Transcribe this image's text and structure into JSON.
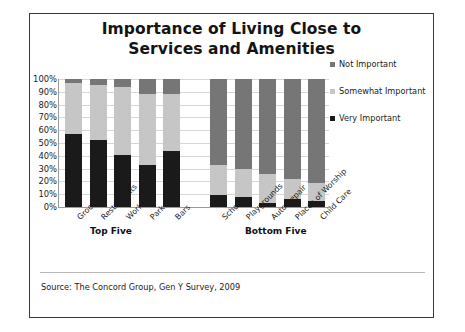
{
  "chart_data": {
    "type": "bar",
    "title": "Importance of Living Close to Services and Amenities",
    "title_line1": "Importance of Living Close to",
    "title_line2": "Services and Amenities",
    "xlabel": "",
    "ylabel": "",
    "ylim": [
      0,
      100
    ],
    "ytick_labels": [
      "100%",
      "90%",
      "80%",
      "70%",
      "60%",
      "50%",
      "40%",
      "30%",
      "20%",
      "10%",
      "0%"
    ],
    "ytick_values": [
      100,
      90,
      80,
      70,
      60,
      50,
      40,
      30,
      20,
      10,
      0
    ],
    "grid": true,
    "stacked": true,
    "stack_total": 100,
    "legend_position": "right",
    "categories": [
      "Grocery",
      "Restaurants",
      "Work",
      "Park",
      "Bars",
      "Schools",
      "Playgrounds",
      "Auto Repair",
      "Places of Worship",
      "Child Care"
    ],
    "series": [
      {
        "name": "Very Important",
        "color": "#1a1a1a",
        "values": [
          57,
          52,
          41,
          33,
          44,
          9,
          8,
          3,
          6,
          5
        ]
      },
      {
        "name": "Somewhat Important",
        "color": "#c6c6c6",
        "values": [
          40,
          43,
          53,
          55,
          44,
          24,
          22,
          23,
          16,
          14
        ]
      },
      {
        "name": "Not Important",
        "color": "#767676",
        "values": [
          3,
          5,
          6,
          12,
          12,
          67,
          70,
          74,
          78,
          81
        ]
      }
    ],
    "groups": [
      {
        "label": "Top Five",
        "categories": [
          "Grocery",
          "Restaurants",
          "Work",
          "Park",
          "Bars"
        ]
      },
      {
        "label": "Bottom Five",
        "categories": [
          "Schools",
          "Playgrounds",
          "Auto Repair",
          "Places of Worship",
          "Child Care"
        ]
      }
    ],
    "annotations": {
      "source": "Source: The Concord Group, Gen Y Survey, 2009"
    }
  },
  "legend": {
    "items": [
      {
        "label": "Not Important",
        "color": "#767676"
      },
      {
        "label": "Somewhat Important",
        "color": "#c6c6c6"
      },
      {
        "label": "Very Important",
        "color": "#1a1a1a"
      }
    ]
  }
}
